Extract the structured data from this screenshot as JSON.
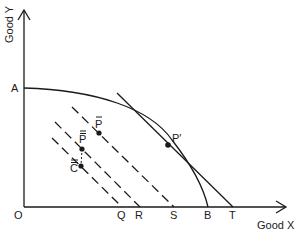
{
  "diagram": {
    "type": "production-possibility-frontier",
    "axes": {
      "y_label": "Good Y",
      "x_label": "Good X",
      "origin_label": "O"
    },
    "frontier": {
      "start_label": "A",
      "end_label": "B"
    },
    "tangent_line": {
      "end_label": "T",
      "tangent_point_label": "P′"
    },
    "budget_lines": [
      {
        "end_label": "Q",
        "style": "dashed"
      },
      {
        "end_label": "R",
        "style": "dashed"
      },
      {
        "end_label": "S",
        "style": "dashed"
      }
    ],
    "points": [
      {
        "label": "P̃",
        "base": "P",
        "mark": "bar"
      },
      {
        "label": "P̿",
        "base": "P",
        "mark": "double-bar"
      },
      {
        "label": "C̿",
        "base": "C",
        "mark": "double-bar"
      },
      {
        "label": "P′",
        "base": "P′",
        "mark": "prime"
      }
    ],
    "colors": {
      "line": "#1a1a1a",
      "background": "#ffffff"
    }
  }
}
